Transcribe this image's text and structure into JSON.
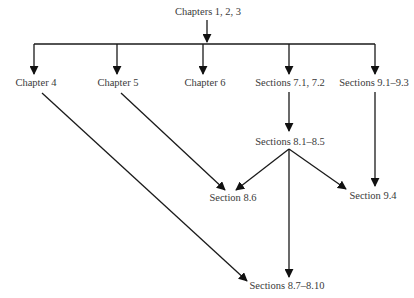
{
  "diagram": {
    "type": "prerequisite-flowchart",
    "colors": {
      "line": "#1a1a1a",
      "text": "#3a3a3a",
      "background": "#ffffff"
    },
    "nodes": {
      "root": {
        "label": "Chapters 1, 2, 3"
      },
      "ch4": {
        "label": "Chapter 4"
      },
      "ch5": {
        "label": "Chapter 5"
      },
      "ch6": {
        "label": "Chapter 6"
      },
      "s71": {
        "label": "Sections 7.1, 7.2"
      },
      "s91": {
        "label": "Sections 9.1–9.3"
      },
      "s81": {
        "label": "Sections 8.1–8.5"
      },
      "s86": {
        "label": "Section 8.6"
      },
      "s94": {
        "label": "Section 9.4"
      },
      "s87": {
        "label": "Sections 8.7–8.10"
      }
    },
    "edges": [
      {
        "from": "Chapters 1, 2, 3",
        "to": "Chapter 4"
      },
      {
        "from": "Chapters 1, 2, 3",
        "to": "Chapter 5"
      },
      {
        "from": "Chapters 1, 2, 3",
        "to": "Chapter 6"
      },
      {
        "from": "Chapters 1, 2, 3",
        "to": "Sections 7.1, 7.2"
      },
      {
        "from": "Chapters 1, 2, 3",
        "to": "Sections 9.1–9.3"
      },
      {
        "from": "Sections 7.1, 7.2",
        "to": "Sections 8.1–8.5"
      },
      {
        "from": "Sections 8.1–8.5",
        "to": "Section 8.6"
      },
      {
        "from": "Sections 8.1–8.5",
        "to": "Section 9.4"
      },
      {
        "from": "Sections 8.1–8.5",
        "to": "Sections 8.7–8.10"
      },
      {
        "from": "Chapter 5",
        "to": "Section 8.6"
      },
      {
        "from": "Chapter 4",
        "to": "Sections 8.7–8.10"
      },
      {
        "from": "Sections 9.1–9.3",
        "to": "Section 9.4"
      }
    ]
  }
}
